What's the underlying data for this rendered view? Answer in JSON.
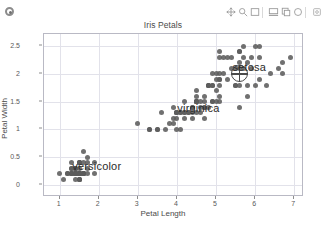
{
  "app": {
    "badge_icon": "record-circle-icon"
  },
  "toolbar": {
    "buttons": [
      {
        "name": "pan-move-icon",
        "label": "Pan / Move"
      },
      {
        "name": "zoom-region-icon",
        "label": "Zoom to region"
      },
      {
        "name": "select-rectangle-icon",
        "label": "Rectangle select"
      },
      {
        "name": "lasso-select-icon",
        "label": "Lasso select"
      },
      {
        "name": "copy-icon",
        "label": "Copy"
      },
      {
        "name": "reset-view-icon",
        "label": "Reset view"
      },
      {
        "name": "settings-icon",
        "label": "Settings"
      }
    ]
  },
  "figure": {
    "title": "Iris Petals",
    "footnote": "",
    "xlabel": "Petal Length",
    "ylabel": "Petal Width"
  },
  "chart_data": {
    "type": "scatter",
    "title": "Iris Petals",
    "xlabel": "Petal Length",
    "ylabel": "Petal Width",
    "xlim": [
      0.6,
      7.2
    ],
    "ylim": [
      -0.18,
      2.72
    ],
    "xticks": [
      1,
      2,
      3,
      4,
      5,
      6,
      7
    ],
    "yticks": [
      0,
      0.5,
      1,
      1.5,
      2,
      2.5
    ],
    "grid": true,
    "legend": "none",
    "marker_color": "#5c5c5c",
    "annotations": [
      {
        "text": "versicolor",
        "x": 1.95,
        "y": 0.35,
        "name": "cluster-label-versicolor"
      },
      {
        "text": "virginica",
        "x": 4.55,
        "y": 1.38,
        "name": "cluster-label-virginica"
      },
      {
        "text": "setosa",
        "x": 5.85,
        "y": 2.12,
        "name": "cluster-label-setosa"
      }
    ],
    "selection_marker": {
      "x": 5.6,
      "y": 2.0,
      "shape": "crosshair-circle"
    },
    "points": [
      [
        1.4,
        0.2
      ],
      [
        1.4,
        0.2
      ],
      [
        1.3,
        0.2
      ],
      [
        1.5,
        0.2
      ],
      [
        1.4,
        0.2
      ],
      [
        1.7,
        0.4
      ],
      [
        1.4,
        0.3
      ],
      [
        1.5,
        0.2
      ],
      [
        1.4,
        0.2
      ],
      [
        1.5,
        0.1
      ],
      [
        1.5,
        0.2
      ],
      [
        1.6,
        0.2
      ],
      [
        1.4,
        0.1
      ],
      [
        1.1,
        0.1
      ],
      [
        1.2,
        0.2
      ],
      [
        1.5,
        0.4
      ],
      [
        1.3,
        0.4
      ],
      [
        1.4,
        0.3
      ],
      [
        1.7,
        0.3
      ],
      [
        1.5,
        0.3
      ],
      [
        1.7,
        0.2
      ],
      [
        1.5,
        0.4
      ],
      [
        1.0,
        0.2
      ],
      [
        1.7,
        0.5
      ],
      [
        1.9,
        0.2
      ],
      [
        1.6,
        0.2
      ],
      [
        1.6,
        0.4
      ],
      [
        1.5,
        0.2
      ],
      [
        1.4,
        0.2
      ],
      [
        1.6,
        0.2
      ],
      [
        1.6,
        0.2
      ],
      [
        1.5,
        0.4
      ],
      [
        1.5,
        0.1
      ],
      [
        1.4,
        0.2
      ],
      [
        1.5,
        0.2
      ],
      [
        1.2,
        0.2
      ],
      [
        1.3,
        0.2
      ],
      [
        1.5,
        0.1
      ],
      [
        1.3,
        0.2
      ],
      [
        1.5,
        0.2
      ],
      [
        1.3,
        0.3
      ],
      [
        1.3,
        0.3
      ],
      [
        1.3,
        0.2
      ],
      [
        1.6,
        0.6
      ],
      [
        1.9,
        0.4
      ],
      [
        1.4,
        0.3
      ],
      [
        1.6,
        0.2
      ],
      [
        1.4,
        0.2
      ],
      [
        1.5,
        0.2
      ],
      [
        1.4,
        0.2
      ],
      [
        4.7,
        1.4
      ],
      [
        4.5,
        1.5
      ],
      [
        4.9,
        1.5
      ],
      [
        4.0,
        1.3
      ],
      [
        4.6,
        1.5
      ],
      [
        4.5,
        1.3
      ],
      [
        4.7,
        1.6
      ],
      [
        3.3,
        1.0
      ],
      [
        4.6,
        1.3
      ],
      [
        3.9,
        1.4
      ],
      [
        3.5,
        1.0
      ],
      [
        4.2,
        1.5
      ],
      [
        4.0,
        1.0
      ],
      [
        4.7,
        1.4
      ],
      [
        3.6,
        1.3
      ],
      [
        4.4,
        1.4
      ],
      [
        4.5,
        1.5
      ],
      [
        4.1,
        1.0
      ],
      [
        4.5,
        1.5
      ],
      [
        3.9,
        1.1
      ],
      [
        4.8,
        1.8
      ],
      [
        4.0,
        1.3
      ],
      [
        4.9,
        1.5
      ],
      [
        4.7,
        1.2
      ],
      [
        4.3,
        1.3
      ],
      [
        4.4,
        1.4
      ],
      [
        4.8,
        1.4
      ],
      [
        5.0,
        1.7
      ],
      [
        4.5,
        1.5
      ],
      [
        3.5,
        1.0
      ],
      [
        3.8,
        1.1
      ],
      [
        3.7,
        1.0
      ],
      [
        3.9,
        1.2
      ],
      [
        5.1,
        1.6
      ],
      [
        4.5,
        1.5
      ],
      [
        4.5,
        1.6
      ],
      [
        4.7,
        1.5
      ],
      [
        4.4,
        1.3
      ],
      [
        4.1,
        1.3
      ],
      [
        4.0,
        1.3
      ],
      [
        4.4,
        1.2
      ],
      [
        4.6,
        1.4
      ],
      [
        4.0,
        1.2
      ],
      [
        3.3,
        1.0
      ],
      [
        4.2,
        1.3
      ],
      [
        4.2,
        1.2
      ],
      [
        4.2,
        1.3
      ],
      [
        4.3,
        1.3
      ],
      [
        3.0,
        1.1
      ],
      [
        4.1,
        1.3
      ],
      [
        6.0,
        2.5
      ],
      [
        5.1,
        1.9
      ],
      [
        5.9,
        2.1
      ],
      [
        5.6,
        1.8
      ],
      [
        5.8,
        2.2
      ],
      [
        6.6,
        2.1
      ],
      [
        4.5,
        1.7
      ],
      [
        6.3,
        1.8
      ],
      [
        5.8,
        1.8
      ],
      [
        6.1,
        2.5
      ],
      [
        5.1,
        2.0
      ],
      [
        5.3,
        1.9
      ],
      [
        5.5,
        2.1
      ],
      [
        5.0,
        2.0
      ],
      [
        5.1,
        2.4
      ],
      [
        5.3,
        2.3
      ],
      [
        5.5,
        1.8
      ],
      [
        6.7,
        2.2
      ],
      [
        6.9,
        2.3
      ],
      [
        5.0,
        1.5
      ],
      [
        5.7,
        2.3
      ],
      [
        4.9,
        2.0
      ],
      [
        6.7,
        2.0
      ],
      [
        4.9,
        1.8
      ],
      [
        5.7,
        2.1
      ],
      [
        6.0,
        1.8
      ],
      [
        4.8,
        1.8
      ],
      [
        4.9,
        1.8
      ],
      [
        5.6,
        2.1
      ],
      [
        5.8,
        1.6
      ],
      [
        6.1,
        1.9
      ],
      [
        6.4,
        2.0
      ],
      [
        5.6,
        2.2
      ],
      [
        5.1,
        1.5
      ],
      [
        5.6,
        1.4
      ],
      [
        6.1,
        2.3
      ],
      [
        5.6,
        2.4
      ],
      [
        5.5,
        1.8
      ],
      [
        4.8,
        1.8
      ],
      [
        5.4,
        2.1
      ],
      [
        5.6,
        2.4
      ],
      [
        5.1,
        2.3
      ],
      [
        5.1,
        1.9
      ],
      [
        5.9,
        2.3
      ],
      [
        5.7,
        2.5
      ],
      [
        5.2,
        2.3
      ],
      [
        5.0,
        1.9
      ],
      [
        5.2,
        2.0
      ],
      [
        5.4,
        2.3
      ],
      [
        5.1,
        1.8
      ]
    ]
  }
}
